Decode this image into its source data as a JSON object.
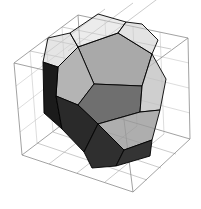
{
  "figure": {
    "title": "",
    "background_color": "#ffffff",
    "width": 201,
    "height": 209
  },
  "bounding_box": {
    "name": "wireframe-bounding-box",
    "edge_color": "#8a8a8a",
    "grid_color": "#a8a8a8",
    "grid_divisions": 4,
    "corners": {
      "back_top_left": [
        14,
        63
      ],
      "back_top_right": [
        78,
        15
      ],
      "front_top_right": [
        188,
        38
      ],
      "front_top_left": [
        120,
        88
      ],
      "back_bot_left": [
        22,
        155
      ],
      "back_bot_right": [
        84,
        108
      ],
      "front_bot_right": [
        190,
        139
      ],
      "front_bot_left": [
        133,
        192
      ]
    }
  },
  "polyhedron": {
    "name": "dodecahedron",
    "face_count": 12,
    "edge_color": "#000000",
    "faces": [
      {
        "id": "face-top-back",
        "shade": "#a9a9a9",
        "opacity": 1,
        "points": "78,47 118,33 152,54 142,86 94,84"
      },
      {
        "id": "face-top-left",
        "shade": "#b4b4b4",
        "opacity": 1,
        "points": "58,67 78,47 94,84 78,105 56,96"
      },
      {
        "id": "face-center-upper",
        "shade": "#6f6f6f",
        "opacity": 1,
        "points": "78,105 94,84 142,86 140,112 98,124"
      },
      {
        "id": "face-left-dark",
        "shade": "#1b1b1b",
        "opacity": 1,
        "points": "43,62 58,67 56,96 62,129 44,113"
      },
      {
        "id": "face-left-lower",
        "shade": "#2a2a2a",
        "opacity": 1,
        "points": "56,96 78,105 98,124 84,152 62,129"
      },
      {
        "id": "face-right-upper",
        "shade": "#bdbdbd",
        "opacity": 0.72,
        "points": "152,54 166,79 160,110 140,112 142,86"
      },
      {
        "id": "face-right-lower",
        "shade": "#9a9a9a",
        "opacity": 0.8,
        "points": "140,112 160,110 152,140 124,150 98,124"
      },
      {
        "id": "face-bottom-front",
        "shade": "#2f2f2f",
        "opacity": 1,
        "points": "84,152 98,124 124,150 116,166 92,168"
      },
      {
        "id": "face-bottom-right",
        "shade": "#343434",
        "opacity": 1,
        "points": "124,150 152,140 150,156 116,166"
      },
      {
        "id": "face-back-upper-left",
        "shade": "#cfcfcf",
        "opacity": 0.55,
        "points": "43,62 58,67 78,47 70,33 48,38"
      },
      {
        "id": "face-back-top",
        "shade": "#d4d4d4",
        "opacity": 0.45,
        "points": "78,47 118,33 126,22 98,14 70,33"
      },
      {
        "id": "face-back-right",
        "shade": "#c8c8c8",
        "opacity": 0.5,
        "points": "118,33 152,54 158,40 142,24 126,22"
      }
    ]
  },
  "legend": {
    "visible": false,
    "entries": []
  },
  "axes": {
    "visible": false,
    "x_label": "",
    "y_label": "",
    "z_label": ""
  },
  "chart_data": {
    "type": "scatter",
    "title": "",
    "xlabel": "",
    "ylabel": "",
    "render_style": "3d-wireframe-with-shaded-solid",
    "object": "regular dodecahedron",
    "vertices": 20,
    "edges": 30,
    "faces": 12,
    "face_shades": [
      "#a9a9a9",
      "#b4b4b4",
      "#6f6f6f",
      "#1b1b1b",
      "#2a2a2a",
      "#bdbdbd",
      "#9a9a9a",
      "#2f2f2f",
      "#343434",
      "#cfcfcf",
      "#d4d4d4",
      "#c8c8c8"
    ],
    "bounding_box_grid_divisions": 4,
    "grid": true,
    "legend_position": "none"
  }
}
